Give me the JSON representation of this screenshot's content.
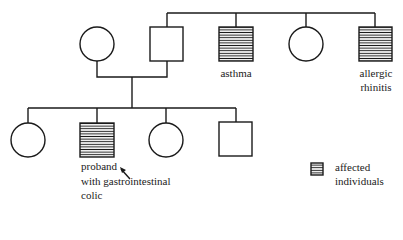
{
  "diagram": {
    "type": "pedigree",
    "colors": {
      "line": "#1a1a1a",
      "background": "#ffffff",
      "hatch": "#1a1a1a"
    },
    "generation_1": [
      {
        "id": "mother",
        "sex": "female",
        "affected": false,
        "label": ""
      },
      {
        "id": "father",
        "sex": "male",
        "affected": false,
        "label": ""
      },
      {
        "id": "father-sibling-1",
        "sex": "male",
        "affected": true,
        "label": "asthma"
      },
      {
        "id": "father-sibling-2",
        "sex": "female",
        "affected": false,
        "label": ""
      },
      {
        "id": "father-sibling-3",
        "sex": "male",
        "affected": true,
        "label_line1": "allergic",
        "label_line2": "rhinitis"
      }
    ],
    "generation_2": [
      {
        "id": "child-1",
        "sex": "female",
        "affected": false
      },
      {
        "id": "child-2-proband",
        "sex": "male",
        "affected": true,
        "label_line1": "proband",
        "label_line2": "with gastrointestinal",
        "label_line3": "colic"
      },
      {
        "id": "child-3",
        "sex": "female",
        "affected": false
      },
      {
        "id": "child-4",
        "sex": "male",
        "affected": false
      }
    ],
    "legend": {
      "symbol": "hatched-square",
      "label_line1": "affected",
      "label_line2": "individuals"
    }
  }
}
